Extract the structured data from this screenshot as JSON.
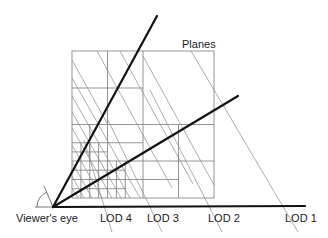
{
  "diagram": {
    "title_label": "Planes",
    "viewer_label": "Viewer's eye",
    "lod_labels": [
      {
        "text": "LOD 4",
        "x": 100,
        "y": 222
      },
      {
        "text": "LOD 3",
        "x": 147,
        "y": 222
      },
      {
        "text": "LOD 2",
        "x": 208,
        "y": 222
      },
      {
        "text": "LOD 1",
        "x": 285,
        "y": 222
      }
    ],
    "colors": {
      "rays": "#111111",
      "grid": "#7a7a7a",
      "planes": "#8a8a8a",
      "text": "#1a1a1a"
    }
  }
}
